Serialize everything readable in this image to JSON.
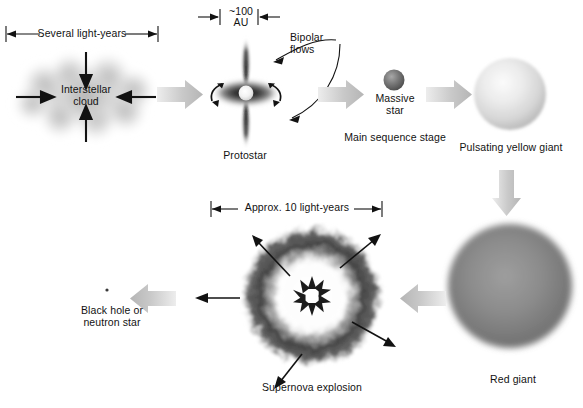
{
  "diagram": {
    "background_color": "#ffffff",
    "ink_color": "#121212",
    "flow_arrow_color": "#c9c9c9"
  },
  "stages": [
    {
      "id": "interstellar-cloud",
      "label": "Interstellar\ncloud",
      "dimension_label": "Several light-years",
      "order": 1
    },
    {
      "id": "protostar",
      "label": "Protostar",
      "dimension_label": "~100\nAU",
      "callout_label": "Bipolar\nflows",
      "order": 2
    },
    {
      "id": "main-sequence",
      "label": "Massive\nstar",
      "caption": "Main sequence stage",
      "order": 3
    },
    {
      "id": "yellow-giant",
      "label": "Pulsating yellow giant",
      "order": 4
    },
    {
      "id": "red-giant",
      "label": "Red giant",
      "order": 5
    },
    {
      "id": "supernova",
      "label": "Supernova explosion",
      "dimension_label": "Approx. 10 light-years",
      "order": 6
    },
    {
      "id": "remnant",
      "label": "Black hole or\nneutron star",
      "order": 7
    }
  ],
  "icons": {
    "flow_arrow_right": "arrow-right-icon",
    "flow_arrow_left": "arrow-left-icon",
    "flow_arrow_down": "arrow-down-icon",
    "collapse_arrow": "collapse-arrow-icon",
    "expansion_arrow": "expansion-arrow-icon",
    "dimension_line": "dimension-line-icon"
  }
}
